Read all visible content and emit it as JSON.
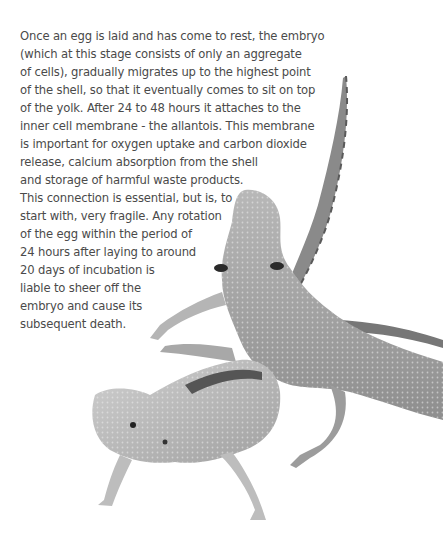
{
  "paragraph": {
    "lines": [
      "Once an egg is laid and has come to rest, the embryo",
      "(which at this stage consists of only an aggregate",
      "of cells), gradually migrates up to the highest point",
      "of the shell, so that it eventually comes to sit on top",
      "of the yolk. After 24 to 48 hours it attaches to the",
      "inner cell membrane - the allantois. This membrane",
      "is important for oxygen uptake and carbon dioxide",
      "release, calcium absorption from the shell",
      "and storage of harmful waste products.",
      "This connection is essential, but is, to",
      "start with, very fragile. Any rotation",
      "of the egg within the period of",
      "24 hours after laying to around",
      "20 days of incubation is",
      "liable to sheer off the",
      "embryo and cause its",
      "subsequent death."
    ]
  },
  "image": {
    "subject": "two bearded dragon lizards",
    "palette": {
      "light": "#c9c9c9",
      "mid": "#9a9a9a",
      "dark": "#555555",
      "background": "#ffffff"
    }
  }
}
